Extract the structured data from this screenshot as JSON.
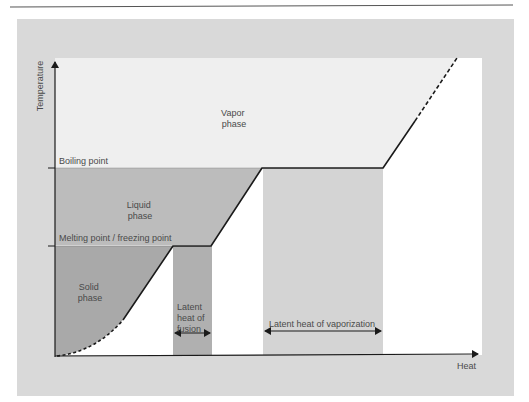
{
  "diagram": {
    "type": "heating-curve",
    "axes": {
      "y_label": "Temperature",
      "x_label": "Heat"
    },
    "reference_lines": {
      "boiling": "Boiling point",
      "melting": "Melting point / freezing point"
    },
    "regions": {
      "vapor": [
        "Vapor",
        "phase"
      ],
      "liquid": [
        "Liquid",
        "phase"
      ],
      "solid": [
        "Solid",
        "phase"
      ]
    },
    "latent_heat": {
      "fusion": [
        "Latent",
        "heat of",
        "fusion"
      ],
      "vaporization": "Latent heat of vaporization"
    },
    "colors": {
      "frame": "#d9d9d9",
      "vapor": "#efefef",
      "liquid": "#bdbdbd",
      "solid": "#a8a8a8",
      "fusion_band": "#b0b0b0",
      "vaporization_band": "#d4d4d4",
      "line": "#1a1a1a",
      "text": "#4a4a4a"
    }
  }
}
